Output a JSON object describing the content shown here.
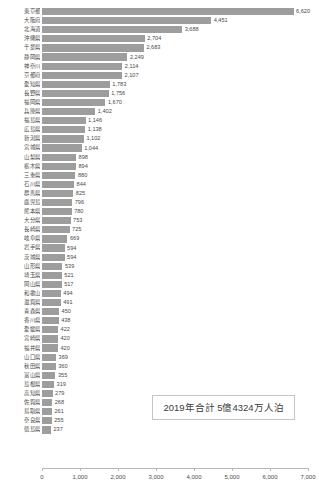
{
  "chart_data": {
    "type": "bar",
    "orientation": "horizontal",
    "title": "",
    "xlabel": "",
    "ylabel": "",
    "xlim": [
      0,
      7000
    ],
    "grid": false,
    "legend": null,
    "bar_color": "#9d9d9d",
    "xticks": [
      "0",
      "1,000",
      "2,000",
      "3,000",
      "4,000",
      "5,000",
      "6,000",
      "7,000"
    ],
    "xtick_values": [
      0,
      1000,
      2000,
      3000,
      4000,
      5000,
      6000,
      7000
    ],
    "categories": [
      "東京都",
      "大阪府",
      "北海道",
      "沖縄県",
      "千葉県",
      "静岡県",
      "神奈川",
      "京都府",
      "愛知県",
      "長野県",
      "福岡県",
      "兵庫県",
      "福島県",
      "広島県",
      "新潟県",
      "宮城県",
      "山梨県",
      "栃木県",
      "三重県",
      "石川県",
      "群馬県",
      "鹿児島",
      "熊本県",
      "大分県",
      "長崎県",
      "岐阜県",
      "岩手県",
      "茨城県",
      "山形県",
      "埼玉県",
      "岡山県",
      "和歌山",
      "滋賀県",
      "青森県",
      "香川県",
      "愛媛県",
      "宮崎県",
      "福井県",
      "山口県",
      "秋田県",
      "富山県",
      "島根県",
      "高知県",
      "佐賀県",
      "鳥取県",
      "奈良県",
      "徳島県"
    ],
    "values": [
      6620,
      4451,
      3688,
      2704,
      2683,
      2249,
      2114,
      2107,
      1783,
      1756,
      1670,
      1402,
      1146,
      1138,
      1102,
      1044,
      898,
      894,
      880,
      844,
      825,
      796,
      780,
      753,
      725,
      669,
      594,
      594,
      539,
      521,
      517,
      494,
      491,
      450,
      438,
      422,
      420,
      420,
      369,
      360,
      355,
      319,
      279,
      268,
      261,
      255,
      237
    ],
    "value_labels": [
      "6,620",
      "4,451",
      "3,688",
      "2,704",
      "2,683",
      "2,249",
      "2,114",
      "2,107",
      "1,783",
      "1,756",
      "1,670",
      "1,402",
      "1,146",
      "1,138",
      "1,102",
      "1,044",
      "898",
      "894",
      "880",
      "844",
      "825",
      "796",
      "780",
      "753",
      "725",
      "669",
      "594",
      "594",
      "539",
      "521",
      "517",
      "494",
      "491",
      "450",
      "438",
      "422",
      "420",
      "420",
      "369",
      "360",
      "355",
      "319",
      "279",
      "268",
      "261",
      "255",
      "237"
    ],
    "annotation": "2019年合計 5億4324万人泊"
  }
}
